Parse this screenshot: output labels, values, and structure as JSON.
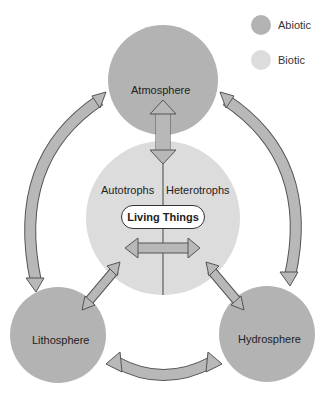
{
  "legend": {
    "items": [
      {
        "label": "Abiotic",
        "color": "#b3b3b3"
      },
      {
        "label": "Biotic",
        "color": "#dcdcdc"
      }
    ]
  },
  "nodes": {
    "atmosphere": {
      "label": "Atmosphere",
      "type": "Abiotic"
    },
    "lithosphere": {
      "label": "Lithosphere",
      "type": "Abiotic"
    },
    "hydrosphere": {
      "label": "Hydrosphere",
      "type": "Abiotic"
    },
    "living_things": {
      "label": "Living Things",
      "type": "Biotic",
      "left_label": "Autotrophs",
      "right_label": "Heterotrophs"
    }
  },
  "colors": {
    "abiotic": "#b3b3b3",
    "biotic": "#dcdcdc",
    "arrow_fill": "#b8b8b8",
    "arrow_stroke": "#555555"
  },
  "connections": [
    {
      "from": "Atmosphere",
      "to": "Living Things",
      "direction": "bidirectional"
    },
    {
      "from": "Atmosphere",
      "to": "Lithosphere",
      "direction": "bidirectional"
    },
    {
      "from": "Atmosphere",
      "to": "Hydrosphere",
      "direction": "bidirectional"
    },
    {
      "from": "Lithosphere",
      "to": "Hydrosphere",
      "direction": "bidirectional"
    },
    {
      "from": "Lithosphere",
      "to": "Living Things",
      "direction": "bidirectional"
    },
    {
      "from": "Hydrosphere",
      "to": "Living Things",
      "direction": "bidirectional"
    },
    {
      "from": "Autotrophs",
      "to": "Heterotrophs",
      "direction": "bidirectional"
    }
  ]
}
